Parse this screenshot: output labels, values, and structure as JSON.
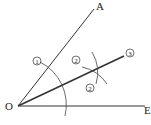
{
  "diagram": {
    "points": {
      "O": {
        "label": "O",
        "x": 18,
        "y": 106
      },
      "A": {
        "label": "A",
        "x": 94,
        "y": 9
      },
      "E": {
        "label": "E",
        "x": 145,
        "y": 106
      },
      "bisector_end": {
        "x": 124,
        "y": 56
      }
    },
    "step_markers": [
      {
        "id": "step-1",
        "text": "1",
        "x": 37,
        "y": 61
      },
      {
        "id": "step-2a",
        "text": "2",
        "x": 76,
        "y": 60
      },
      {
        "id": "step-2b",
        "text": "2",
        "x": 90,
        "y": 88
      },
      {
        "id": "step-3",
        "text": "3",
        "x": 130,
        "y": 53
      }
    ],
    "colors": {
      "stroke": "#333333",
      "background": "#ffffff"
    }
  }
}
